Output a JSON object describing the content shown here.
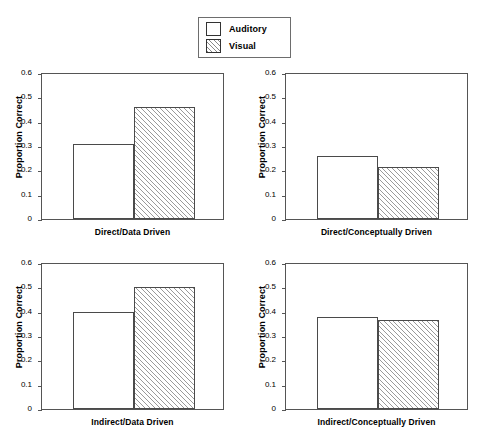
{
  "legend": {
    "items": [
      {
        "label": "Auditory",
        "swatch": "open-square-swatch"
      },
      {
        "label": "Visual",
        "swatch": "hatched-square-swatch"
      }
    ]
  },
  "axis": {
    "ylabel": "Proportion Correct",
    "yticks": [
      "0",
      "0.1",
      "0.2",
      "0.3",
      "0.4",
      "0.5",
      "0.6"
    ]
  },
  "chart_data": {
    "type": "bar",
    "title": "",
    "xlabel": "",
    "ylabel": "Proportion Correct",
    "ylim": [
      0,
      0.6
    ],
    "ytick_values": [
      0,
      0.1,
      0.2,
      0.3,
      0.4,
      0.5,
      0.6
    ],
    "grid": false,
    "legend_position": "top-center",
    "series_names": [
      "Auditory",
      "Visual"
    ],
    "panels": [
      {
        "id": "direct-data-driven",
        "categories": [
          "Direct/Data Driven"
        ],
        "xlabel": "Direct/Data Driven",
        "series": [
          {
            "name": "Auditory",
            "values": [
              0.31
            ]
          },
          {
            "name": "Visual",
            "values": [
              0.46
            ]
          }
        ]
      },
      {
        "id": "direct-conceptually-driven",
        "categories": [
          "Direct/Conceptually Driven"
        ],
        "xlabel": "Direct/Conceptually Driven",
        "series": [
          {
            "name": "Auditory",
            "values": [
              0.26
            ]
          },
          {
            "name": "Visual",
            "values": [
              0.215
            ]
          }
        ]
      },
      {
        "id": "indirect-data-driven",
        "categories": [
          "Indirect/Data Driven"
        ],
        "xlabel": "Indirect/Data Driven",
        "series": [
          {
            "name": "Auditory",
            "values": [
              0.4
            ]
          },
          {
            "name": "Visual",
            "values": [
              0.5
            ]
          }
        ]
      },
      {
        "id": "indirect-conceptually-driven",
        "categories": [
          "Indirect/Conceptually Driven"
        ],
        "xlabel": "Indirect/Conceptually Driven",
        "series": [
          {
            "name": "Auditory",
            "values": [
              0.38
            ]
          },
          {
            "name": "Visual",
            "values": [
              0.367
            ]
          }
        ]
      }
    ]
  }
}
